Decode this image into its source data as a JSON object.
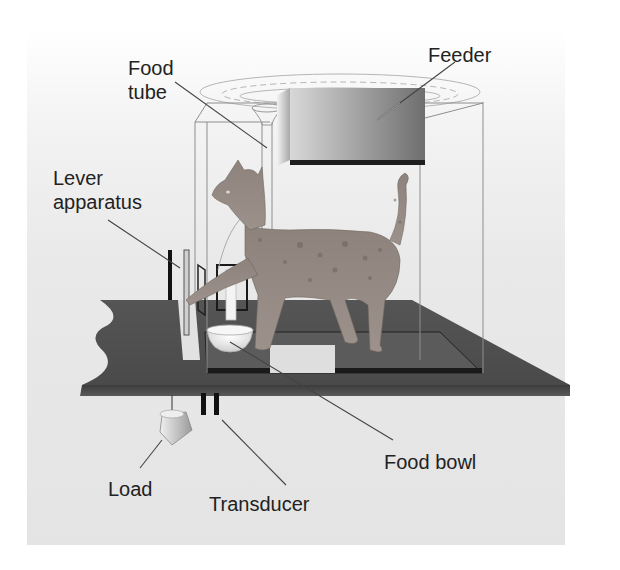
{
  "diagram": {
    "type": "apparatus-illustration",
    "labels": {
      "feeder": "Feeder",
      "food_tube_line1": "Food",
      "food_tube_line2": "tube",
      "lever_line1": "Lever",
      "lever_line2": "apparatus",
      "food_bowl": "Food bowl",
      "load": "Load",
      "transducer": "Transducer"
    },
    "colors": {
      "background_panel": "#e6e6e6",
      "platform": "#4a4a4a",
      "platform_edge": "#3a3a3a",
      "cage_lines": "#8a8a8a",
      "feeder_box": "#8c8c8c",
      "cat_fur": "#8a7f78",
      "leader_lines": "#444444",
      "text": "#222222"
    }
  }
}
